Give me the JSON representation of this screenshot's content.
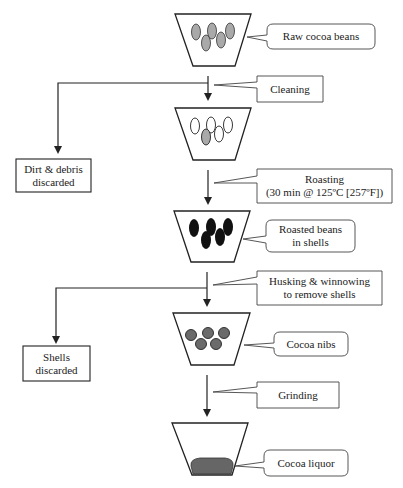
{
  "diagram": {
    "type": "process-flow",
    "stages": [
      {
        "id": "raw",
        "label": "Raw cocoa beans",
        "bean_style": "gray-ovals"
      },
      {
        "id": "cleaned",
        "bean_style": "white-ovals"
      },
      {
        "id": "roasted",
        "label_line1": "Roasted beans",
        "label_line2": "in shells",
        "bean_style": "black-ovals"
      },
      {
        "id": "nibs",
        "label": "Cocoa nibs",
        "bean_style": "dark-gray-circles"
      },
      {
        "id": "liquor",
        "label": "Cocoa liquor",
        "bean_style": "liquid"
      }
    ],
    "steps": [
      {
        "id": "cleaning",
        "label": "Cleaning"
      },
      {
        "id": "roasting",
        "label_line1": "Roasting",
        "label_line2": "(30 min @ 125ºC [257ºF])"
      },
      {
        "id": "husking",
        "label_line1": "Husking & winnowing",
        "label_line2": "to remove shells"
      },
      {
        "id": "grinding",
        "label": "Grinding"
      }
    ],
    "byproducts": [
      {
        "id": "dirt",
        "label_line1": "Dirt & debris",
        "label_line2": "discarded"
      },
      {
        "id": "shells",
        "label_line1": "Shells",
        "label_line2": "discarded"
      }
    ],
    "colors": {
      "line": "#222222",
      "bean_gray": "#a9a9a9",
      "bean_black": "#111111",
      "nib": "#6b6b6b",
      "liquor": "#666666"
    }
  }
}
